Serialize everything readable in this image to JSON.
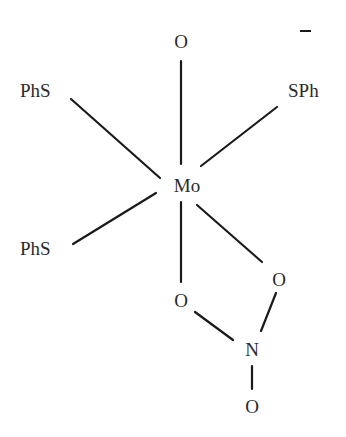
{
  "diagram": {
    "type": "chemical-structure",
    "charge": "−",
    "center_atom": "Mo",
    "atoms": {
      "o_top": "O",
      "phs_upper_left": "PhS",
      "sph_upper_right": "SPh",
      "mo": "Mo",
      "phs_lower_left": "PhS",
      "o_lower_left": "O",
      "o_lower_right": "O",
      "n": "N",
      "o_bottom": "O"
    },
    "bonds": [
      {
        "from": "Mo",
        "to": "O (top)"
      },
      {
        "from": "Mo",
        "to": "PhS (upper-left)"
      },
      {
        "from": "Mo",
        "to": "SPh (upper-right)"
      },
      {
        "from": "Mo",
        "to": "PhS (lower-left)"
      },
      {
        "from": "Mo",
        "to": "O (lower-left)"
      },
      {
        "from": "Mo",
        "to": "O (lower-right)"
      },
      {
        "from": "O (lower-left)",
        "to": "N"
      },
      {
        "from": "O (lower-right)",
        "to": "N"
      },
      {
        "from": "N",
        "to": "O (bottom)"
      }
    ]
  }
}
